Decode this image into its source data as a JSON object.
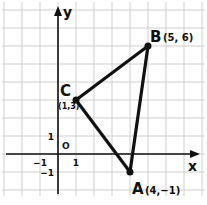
{
  "axes": {
    "x_label": "x",
    "y_label": "y",
    "origin_label": "O",
    "x_ticks": [
      {
        "value": -1,
        "label": "−1"
      },
      {
        "value": 1,
        "label": "1"
      }
    ],
    "y_ticks": [
      {
        "value": 1,
        "label": "1"
      },
      {
        "value": -1,
        "label": "−1"
      }
    ],
    "x_range": [
      -3,
      8
    ],
    "y_range": [
      -2,
      8
    ]
  },
  "points": [
    {
      "name": "A",
      "x": 4,
      "y": -1,
      "coord_label": "(4,−1)"
    },
    {
      "name": "B",
      "x": 5,
      "y": 6,
      "coord_label": "(5, 6)"
    },
    {
      "name": "C",
      "x": 1,
      "y": 3,
      "coord_label": "(1,3)"
    }
  ],
  "segments": [
    [
      "A",
      "B"
    ],
    [
      "B",
      "C"
    ],
    [
      "C",
      "A"
    ]
  ],
  "colors": {
    "grid": "#cfcfcf",
    "ink": "#111111",
    "background": "#ffffff"
  }
}
